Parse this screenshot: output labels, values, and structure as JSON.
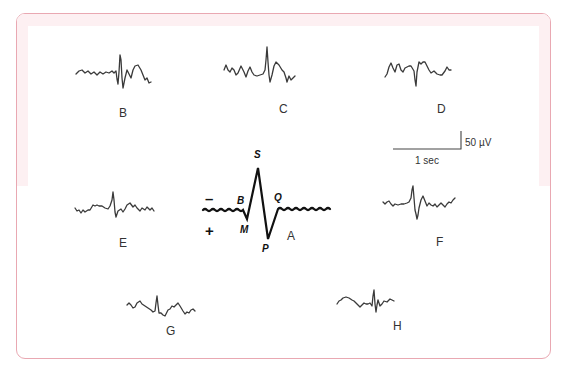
{
  "figure": {
    "panels": [
      {
        "id": "B",
        "label": "B"
      },
      {
        "id": "C",
        "label": "C"
      },
      {
        "id": "D",
        "label": "D"
      },
      {
        "id": "E",
        "label": "E"
      },
      {
        "id": "A",
        "label": "A"
      },
      {
        "id": "F",
        "label": "F"
      },
      {
        "id": "G",
        "label": "G"
      },
      {
        "id": "H",
        "label": "H"
      }
    ],
    "main_waveform": {
      "label": "A",
      "points": {
        "S": "S",
        "B": "B",
        "Q": "Q",
        "M": "M",
        "P": "P"
      },
      "polarity": {
        "negative": "–",
        "positive": "+"
      }
    },
    "scale_bar": {
      "amplitude": "50 µV",
      "time": "1 sec"
    },
    "colors": {
      "border": "#e9a8b2",
      "tint": "#fdf0f2",
      "trace": "#3a3a3a",
      "main_trace": "#111111"
    }
  }
}
